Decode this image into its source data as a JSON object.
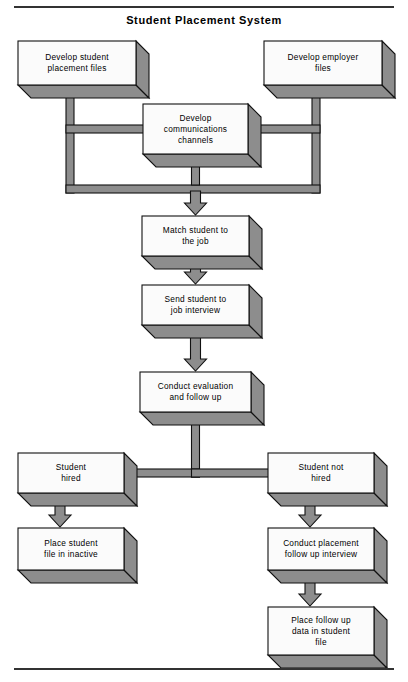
{
  "title": "Student Placement System",
  "diagram": {
    "type": "flowchart",
    "style": "3d-block-boxes-with-block-arrows",
    "colors": {
      "box_fill": "#fbfbfb",
      "shadow_fill": "#8d8d8d",
      "outline": "#111111",
      "rule": "#333333"
    },
    "nodes": [
      {
        "id": "develop-student-placement-files",
        "lines": [
          "Develop student",
          "placement files"
        ],
        "x": 18,
        "y": 41,
        "w": 118,
        "h": 44
      },
      {
        "id": "develop-employer-files",
        "lines": [
          "Develop employer",
          "files"
        ],
        "x": 264,
        "y": 41,
        "w": 118,
        "h": 44
      },
      {
        "id": "develop-communications-channels",
        "lines": [
          "Develop",
          "communications",
          "channels"
        ],
        "x": 143,
        "y": 104,
        "w": 105,
        "h": 50
      },
      {
        "id": "match-student-to-the-job",
        "lines": [
          "Match student to",
          "the job"
        ],
        "x": 142,
        "y": 216,
        "w": 107,
        "h": 40
      },
      {
        "id": "send-student-to-job-interview",
        "lines": [
          "Send student to",
          "job interview"
        ],
        "x": 142,
        "y": 285,
        "w": 107,
        "h": 40
      },
      {
        "id": "conduct-evaluation-and-follow-up",
        "lines": [
          "Conduct evaluation",
          "and follow up"
        ],
        "x": 140,
        "y": 372,
        "w": 111,
        "h": 40
      },
      {
        "id": "student-hired",
        "lines": [
          "Student",
          "hired"
        ],
        "x": 18,
        "y": 453,
        "w": 106,
        "h": 40
      },
      {
        "id": "student-not-hired",
        "lines": [
          "Student not",
          "hired"
        ],
        "x": 268,
        "y": 453,
        "w": 106,
        "h": 40
      },
      {
        "id": "place-student-file-in-inactive",
        "lines": [
          "Place student",
          "file in inactive"
        ],
        "x": 18,
        "y": 528,
        "w": 106,
        "h": 42
      },
      {
        "id": "conduct-placement-follow-up-interview",
        "lines": [
          "Conduct placement",
          "follow up interview"
        ],
        "x": 268,
        "y": 528,
        "w": 106,
        "h": 42
      },
      {
        "id": "place-follow-up-data-in-student-file",
        "lines": [
          "Place follow up",
          "data in student",
          "file"
        ],
        "x": 268,
        "y": 607,
        "w": 106,
        "h": 48
      }
    ],
    "edges": [
      {
        "from": "develop-student-placement-files",
        "to": "develop-communications-channels",
        "kind": "elbow-right"
      },
      {
        "from": "develop-employer-files",
        "to": "develop-communications-channels",
        "kind": "elbow-left"
      },
      {
        "from": "develop-student-placement-files",
        "to": "match-student-to-the-job",
        "kind": "bus-down-arrow"
      },
      {
        "from": "develop-employer-files",
        "to": "match-student-to-the-job",
        "kind": "bus-down-arrow"
      },
      {
        "from": "develop-communications-channels",
        "to": "match-student-to-the-job",
        "kind": "down-arrow"
      },
      {
        "from": "match-student-to-the-job",
        "to": "send-student-to-job-interview",
        "kind": "down-arrow"
      },
      {
        "from": "send-student-to-job-interview",
        "to": "conduct-evaluation-and-follow-up",
        "kind": "down-arrow"
      },
      {
        "from": "conduct-evaluation-and-follow-up",
        "to": "student-hired",
        "kind": "split-left"
      },
      {
        "from": "conduct-evaluation-and-follow-up",
        "to": "student-not-hired",
        "kind": "split-right"
      },
      {
        "from": "student-hired",
        "to": "place-student-file-in-inactive",
        "kind": "down-arrow"
      },
      {
        "from": "student-not-hired",
        "to": "conduct-placement-follow-up-interview",
        "kind": "down-arrow"
      },
      {
        "from": "conduct-placement-follow-up-interview",
        "to": "place-follow-up-data-in-student-file",
        "kind": "down-arrow"
      }
    ]
  }
}
